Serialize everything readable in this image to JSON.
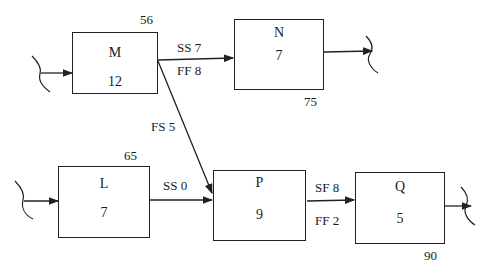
{
  "diagram": {
    "type": "precedence-network",
    "activities": [
      {
        "id": "M",
        "duration": "12",
        "note": "56"
      },
      {
        "id": "N",
        "duration": "7",
        "note": "75"
      },
      {
        "id": "L",
        "duration": "7",
        "note": "65"
      },
      {
        "id": "P",
        "duration": "9",
        "note": ""
      },
      {
        "id": "Q",
        "duration": "5",
        "note": "90"
      }
    ],
    "relations": [
      {
        "from": "M",
        "to": "N",
        "labels": [
          "SS 7",
          "FF 8"
        ]
      },
      {
        "from": "M",
        "to": "P",
        "labels": [
          "FS 5"
        ]
      },
      {
        "from": "L",
        "to": "P",
        "labels": [
          "SS 0"
        ]
      },
      {
        "from": "P",
        "to": "Q",
        "labels": [
          "SF 8",
          "FF 2"
        ]
      }
    ],
    "colors": {
      "line": "#222222",
      "background": "#ffffff"
    }
  }
}
